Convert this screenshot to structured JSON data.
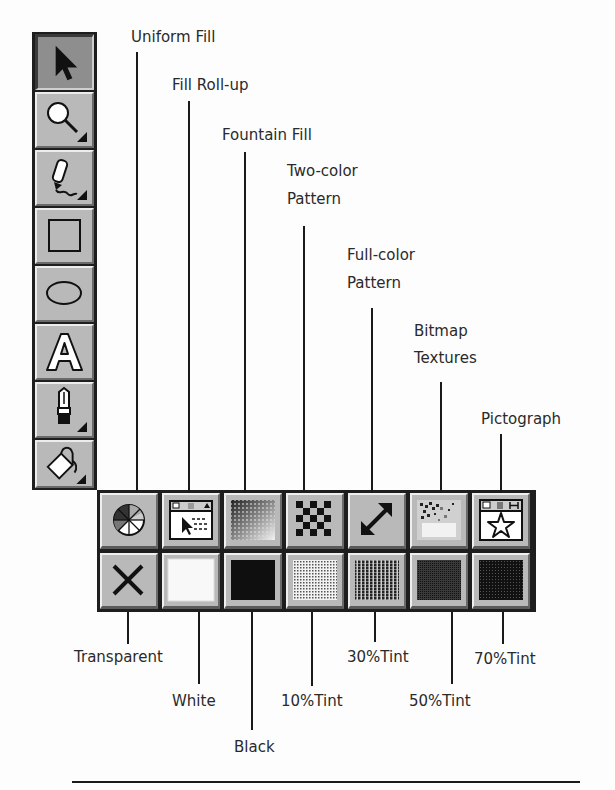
{
  "toolbox": {
    "tools": [
      {
        "name": "Pick Tool",
        "icon": "arrow-pointer-icon",
        "active": true
      },
      {
        "name": "Zoom Tool",
        "icon": "magnifier-icon",
        "active": false,
        "flyout": true
      },
      {
        "name": "Pencil Tool",
        "icon": "pencil-icon",
        "active": false,
        "flyout": true
      },
      {
        "name": "Rectangle Tool",
        "icon": "rectangle-icon",
        "active": false
      },
      {
        "name": "Ellipse Tool",
        "icon": "ellipse-icon",
        "active": false
      },
      {
        "name": "Text Tool",
        "icon": "letter-a-icon",
        "active": false
      },
      {
        "name": "Outline Tool",
        "icon": "pen-nib-icon",
        "active": false,
        "flyout": true
      },
      {
        "name": "Fill Tool",
        "icon": "paint-bucket-icon",
        "active": false,
        "flyout": true
      }
    ]
  },
  "fill_flyout": {
    "top_row": [
      {
        "label": "Uniform Fill",
        "icon": "color-wheel-icon"
      },
      {
        "label": "Fill Roll-up",
        "icon": "rollup-window-icon"
      },
      {
        "label": "Fountain Fill",
        "icon": "gradient-icon"
      },
      {
        "label": "Two-color Pattern",
        "line1": "Two-color",
        "line2": "Pattern",
        "icon": "checkerboard-icon"
      },
      {
        "label": "Full-color Pattern",
        "line1": "Full-color",
        "line2": "Pattern",
        "icon": "diagonal-arrow-icon"
      },
      {
        "label": "Bitmap Textures",
        "line1": "Bitmap",
        "line2": "Textures",
        "icon": "texture-icon"
      },
      {
        "label": "Pictograph",
        "icon": "star-pictograph-icon"
      }
    ],
    "bottom_row": [
      {
        "label": "Transparent",
        "icon": "x-icon"
      },
      {
        "label": "White",
        "icon": "white-swatch-icon"
      },
      {
        "label": "Black",
        "icon": "black-swatch-icon"
      },
      {
        "label": "10%Tint",
        "icon": "tint-10-icon"
      },
      {
        "label": "30%Tint",
        "icon": "tint-30-icon"
      },
      {
        "label": "50%Tint",
        "icon": "tint-50-icon"
      },
      {
        "label": "70%Tint",
        "icon": "tint-70-icon"
      }
    ]
  }
}
